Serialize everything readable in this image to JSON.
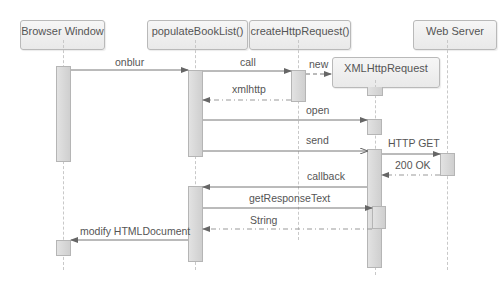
{
  "diagram": {
    "type": "sequence",
    "participants": [
      {
        "id": "browser",
        "label": "Browser Window"
      },
      {
        "id": "populate",
        "label": "populateBookList()"
      },
      {
        "id": "create",
        "label": "createHttpRequest()"
      },
      {
        "id": "xhr",
        "label": "XMLHttpRequest"
      },
      {
        "id": "server",
        "label": "Web Server"
      }
    ],
    "messages": [
      {
        "from": "browser",
        "to": "populate",
        "label": "onblur",
        "style": "sync"
      },
      {
        "from": "populate",
        "to": "create",
        "label": "call",
        "style": "sync"
      },
      {
        "from": "create",
        "to": "xhr",
        "label": "new",
        "style": "create-dashed"
      },
      {
        "from": "create",
        "to": "populate",
        "label": "xmlhttp",
        "style": "return"
      },
      {
        "from": "populate",
        "to": "xhr",
        "label": "open",
        "style": "sync"
      },
      {
        "from": "populate",
        "to": "xhr",
        "label": "send",
        "style": "async"
      },
      {
        "from": "xhr",
        "to": "server",
        "label": "HTTP GET",
        "style": "sync"
      },
      {
        "from": "server",
        "to": "xhr",
        "label": "200 OK",
        "style": "return"
      },
      {
        "from": "xhr",
        "to": "populate",
        "label": "callback",
        "style": "sync"
      },
      {
        "from": "populate",
        "to": "xhr",
        "label": "getResponseText",
        "style": "sync"
      },
      {
        "from": "xhr",
        "to": "populate",
        "label": "String",
        "style": "return"
      },
      {
        "from": "populate",
        "to": "browser",
        "label": "modify HTMLDocument",
        "style": "sync"
      }
    ]
  }
}
